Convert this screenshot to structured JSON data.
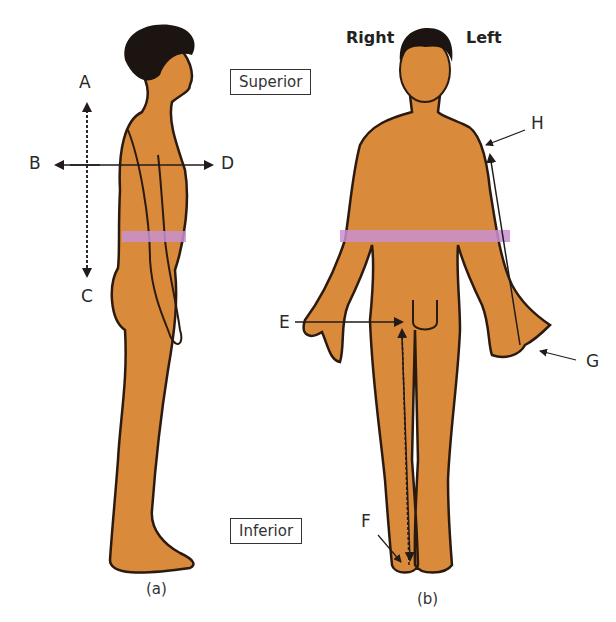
{
  "figure": {
    "panel_a": {
      "caption": "(a)",
      "view": "lateral",
      "labels": {
        "A": "A",
        "B": "B",
        "C": "C",
        "D": "D"
      }
    },
    "panel_b": {
      "caption": "(b)",
      "view": "anterior",
      "side_labels": {
        "right": "Right",
        "left": "Left"
      },
      "labels": {
        "E": "E",
        "F": "F",
        "G": "G",
        "H": "H"
      }
    },
    "boxes": {
      "superior": "Superior",
      "inferior": "Inferior"
    },
    "colors": {
      "skin": "#d98a3a",
      "outline": "#2b1a10",
      "hair": "#1c1410",
      "band": "#c98fd0",
      "arrow": "#231a1a"
    }
  }
}
